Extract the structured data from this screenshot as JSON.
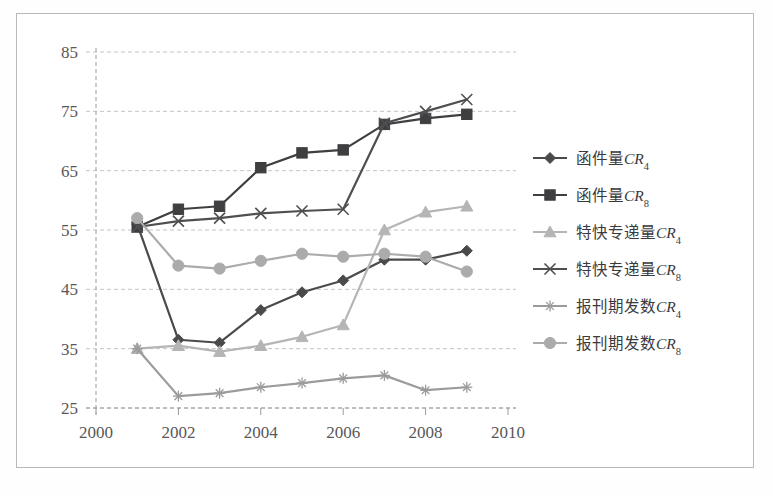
{
  "chart_data": {
    "type": "line",
    "title": "",
    "xlabel": "",
    "ylabel": "",
    "x": [
      2001,
      2002,
      2003,
      2004,
      2005,
      2006,
      2007,
      2008,
      2009
    ],
    "xlim": [
      2000,
      2010
    ],
    "ylim": [
      25,
      85
    ],
    "xticks": [
      "2000",
      "2002",
      "2004",
      "2006",
      "2008",
      "2010"
    ],
    "xtick_values": [
      2000,
      2002,
      2004,
      2006,
      2008,
      2010
    ],
    "yticks": [
      "25",
      "35",
      "45",
      "55",
      "65",
      "75",
      "85"
    ],
    "ytick_values": [
      25,
      35,
      45,
      55,
      65,
      75,
      85
    ],
    "grid": true,
    "grid_style": "dashed-horizontal",
    "legend_position": "right",
    "series": [
      {
        "name": "函件量CR4",
        "label_main": "函件量",
        "label_cr": "CR",
        "label_sub": "4",
        "marker": "diamond",
        "color": "#4a4a4c",
        "values": [
          56.0,
          36.5,
          36.0,
          41.5,
          44.5,
          46.5,
          50.0,
          50.0,
          51.5
        ]
      },
      {
        "name": "函件量CR8",
        "label_main": "函件量",
        "label_cr": "CR",
        "label_sub": "8",
        "marker": "square",
        "color": "#3f3f41",
        "values": [
          55.5,
          58.5,
          59.0,
          65.5,
          68.0,
          68.5,
          72.8,
          73.8,
          74.5
        ]
      },
      {
        "name": "特快专递量CR4",
        "label_main": "特快专递量",
        "label_cr": "CR",
        "label_sub": "4",
        "marker": "triangle",
        "color": "#b5b5b5",
        "values": [
          35.0,
          35.5,
          34.5,
          35.5,
          37.0,
          39.0,
          55.0,
          58.0,
          59.0
        ]
      },
      {
        "name": "特快专递量CR8",
        "label_main": "特快专递量",
        "label_cr": "CR",
        "label_sub": "8",
        "marker": "cross",
        "color": "#4f4f52",
        "values": [
          55.5,
          56.5,
          57.0,
          57.8,
          58.2,
          58.5,
          73.0,
          75.0,
          77.0
        ]
      },
      {
        "name": "报刊期发数CR4",
        "label_main": "报刊期发数",
        "label_cr": "CR",
        "label_sub": "4",
        "marker": "star",
        "color": "#9b9b9b",
        "values": [
          35.0,
          27.0,
          27.5,
          28.5,
          29.2,
          30.0,
          30.5,
          28.0,
          28.5
        ]
      },
      {
        "name": "报刊期发数CR8",
        "label_main": "报刊期发数",
        "label_cr": "CR",
        "label_sub": "8",
        "marker": "circle",
        "color": "#ababab",
        "values": [
          57.0,
          49.0,
          48.5,
          49.8,
          51.0,
          50.5,
          51.0,
          50.5,
          48.0
        ]
      }
    ]
  },
  "colors": {
    "frame": "#b9b9b9",
    "grid": "#c4c4c4",
    "axis": "#9a9a9a",
    "tick_text": "#58585a",
    "background": "#ffffff"
  }
}
